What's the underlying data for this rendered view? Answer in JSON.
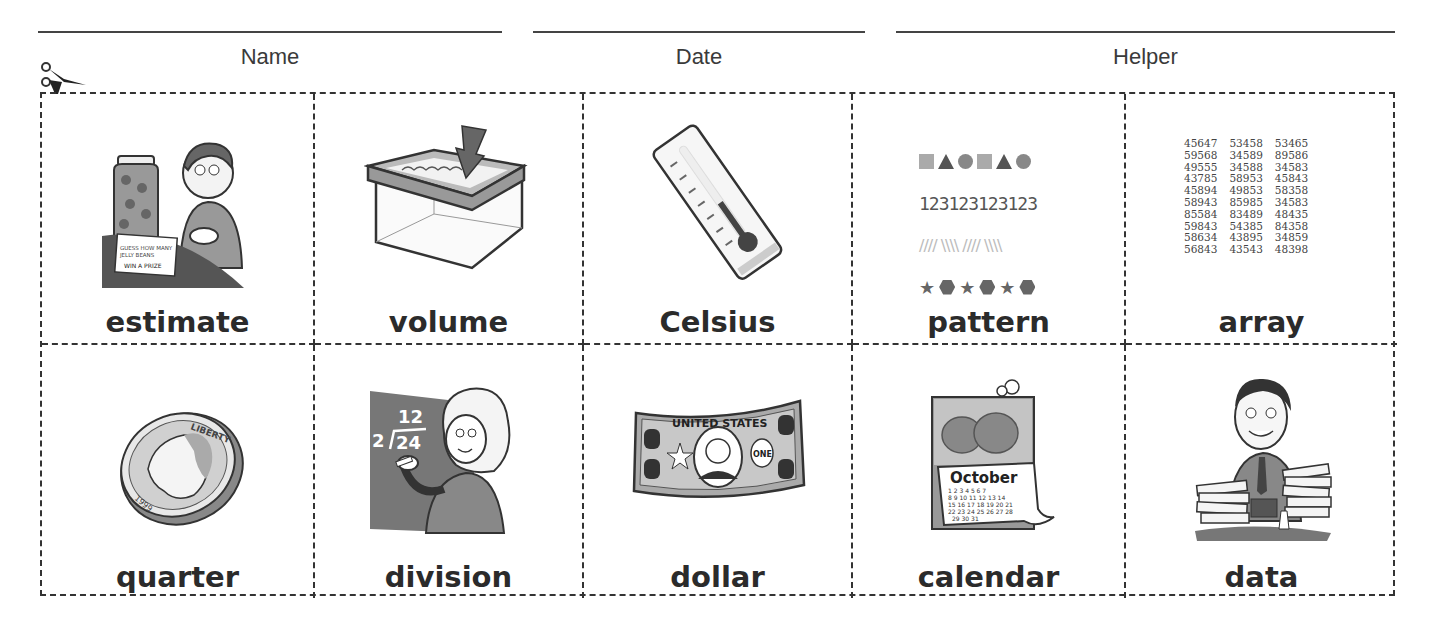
{
  "header": {
    "fields": [
      {
        "label": "Name"
      },
      {
        "label": "Date"
      },
      {
        "label": "Helper"
      }
    ]
  },
  "cut_icon": "scissors-icon",
  "cards": [
    {
      "word": "estimate",
      "image": "boy-guessing-jelly-beans-jar",
      "sign_text": "GUESS HOW MANY JELLY BEANS WIN A PRIZE"
    },
    {
      "word": "volume",
      "image": "box-being-filled-with-arrow"
    },
    {
      "word": "Celsius",
      "image": "thermometer"
    },
    {
      "word": "pattern",
      "image": "shape-number-line-patterns",
      "pattern_rows": {
        "shapes": [
          "square",
          "triangle",
          "circle",
          "square",
          "triangle",
          "circle"
        ],
        "digits": "123123123123",
        "lines": "//// \\\\\\\\ //// \\\\\\\\",
        "shapes2": [
          "star",
          "hexagon",
          "star",
          "hexagon",
          "star",
          "hexagon"
        ]
      }
    },
    {
      "word": "array",
      "image": "number-array",
      "array_rows": [
        [
          "45647",
          "53458",
          "53465"
        ],
        [
          "59568",
          "34589",
          "89586"
        ],
        [
          "49555",
          "34588",
          "34583"
        ],
        [
          "43785",
          "58953",
          "45843"
        ],
        [
          "45894",
          "49853",
          "58358"
        ],
        [
          "58943",
          "85985",
          "34583"
        ],
        [
          "85584",
          "83489",
          "48435"
        ],
        [
          "59843",
          "54385",
          "84358"
        ],
        [
          "58634",
          "43895",
          "34859"
        ],
        [
          "56843",
          "43543",
          "48398"
        ]
      ]
    },
    {
      "word": "quarter",
      "image": "quarter-coin",
      "coin_text": "LIBERTY",
      "coin_year": "1999"
    },
    {
      "word": "division",
      "image": "teacher-at-chalkboard",
      "problem_divisor": "2",
      "problem_dividend": "24",
      "problem_quotient": "12"
    },
    {
      "word": "dollar",
      "image": "dollar-bill",
      "bill_text": "UNITED STATES",
      "bill_value": "ONE",
      "corner_value": "1"
    },
    {
      "word": "calendar",
      "image": "october-calendar",
      "month": "October",
      "days": "1 2 3 4 5 6 7 8 9 10 11 12 13 14 15 16 17 18 19 20 21 22 23 24 25 26 27 28 29 30 31"
    },
    {
      "word": "data",
      "image": "man-with-paper-stacks"
    }
  ]
}
